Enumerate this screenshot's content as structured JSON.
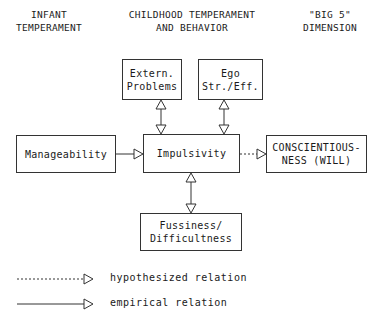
{
  "headers": {
    "infant": "INFANT\nTEMPERAMENT",
    "childhood": "CHILDHOOD TEMPERAMENT\nAND BEHAVIOR",
    "big5": "\"BIG 5\"\nDIMENSION"
  },
  "nodes": {
    "extern": "Extern.\nProblems",
    "ego": "Ego\nStr./Eff.",
    "manageability": "Manageability",
    "impulsivity": "Impulsivity",
    "conscientiousness": "CONSCIENTIOUS-\nNESS (WILL)",
    "fussiness": "Fussiness/\nDifficultness"
  },
  "edges": [
    {
      "from": "manageability",
      "to": "impulsivity",
      "style": "solid",
      "direction": "forward"
    },
    {
      "from": "impulsivity",
      "to": "conscientiousness",
      "style": "dashed",
      "direction": "forward"
    },
    {
      "from": "impulsivity",
      "to": "extern",
      "style": "solid",
      "direction": "both"
    },
    {
      "from": "impulsivity",
      "to": "ego",
      "style": "solid",
      "direction": "both"
    },
    {
      "from": "impulsivity",
      "to": "fussiness",
      "style": "solid",
      "direction": "both"
    }
  ],
  "legend": {
    "hypothesized": "hypothesized relation",
    "empirical": "empirical relation"
  }
}
